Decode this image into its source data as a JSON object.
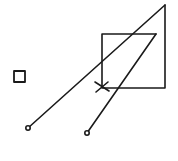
{
  "diagram": {
    "type": "hand-drawn sketch",
    "stroke_color": "#1a1a1a",
    "background": "#ffffff",
    "shapes": {
      "small_square": {
        "x": 14,
        "y": 71,
        "w": 11,
        "h": 11
      },
      "rectangle": {
        "points": "156,34 102,34 102,88 165,88 165,5"
      },
      "long_line": {
        "x1": 28,
        "y1": 128,
        "x2": 165,
        "y2": 5
      },
      "short_line": {
        "x1": 87,
        "y1": 133,
        "x2": 156,
        "y2": 34
      },
      "x_mark": {
        "cx": 102,
        "cy": 86
      },
      "endpoint_a": {
        "cx": 28,
        "cy": 128,
        "r": 2.2
      },
      "endpoint_b": {
        "cx": 87,
        "cy": 133,
        "r": 2.2
      }
    }
  }
}
